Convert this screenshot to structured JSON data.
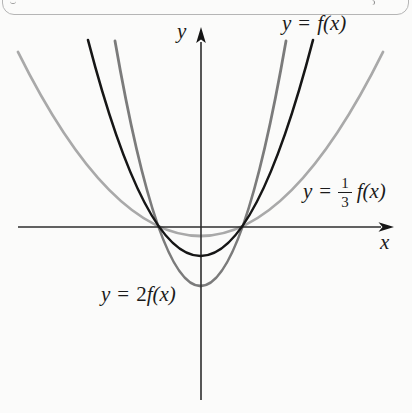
{
  "figure": {
    "axis_labels": {
      "x": "x",
      "y": "y"
    },
    "labels": {
      "f": {
        "y": "y",
        "eq": "=",
        "rhs": "f(x)"
      },
      "two_f": {
        "y": "y",
        "eq": "=",
        "coef": "2",
        "rhs": "f(x)"
      },
      "third_f": {
        "y": "y",
        "eq": "=",
        "num": "1",
        "den": "3",
        "rhs": "f(x)"
      }
    },
    "plot": {
      "axes": {
        "color": "#2e2e2e",
        "arrow_color": "#151515",
        "stroke_width": 1.6,
        "x": {
          "y": 227,
          "from": 18,
          "to": 381,
          "tip": 394
        },
        "y": {
          "x": 201,
          "from": 400,
          "to": 42,
          "tip": 27
        }
      },
      "curves": [
        {
          "id": "one-third-f",
          "label": "y = (1/3)f(x)",
          "color": "#a9a9a9",
          "width": 2.8,
          "layer": "below-axes",
          "x1": 18,
          "y1": 52,
          "x2": 383,
          "y2": 52,
          "vx": 200.5,
          "vy": 236
        },
        {
          "id": "two-f",
          "label": "y = 2f(x)",
          "color": "#7b7b7b",
          "width": 2.8,
          "layer": "below-axes",
          "x1": 115,
          "y1": 41,
          "x2": 286,
          "y2": 41,
          "vx": 200.5,
          "vy": 286
        },
        {
          "id": "f",
          "label": "y = f(x)",
          "color": "#161616",
          "width": 2.6,
          "layer": "above-axes",
          "x1": 88,
          "y1": 40,
          "x2": 313,
          "y2": 40,
          "vx": 200.5,
          "vy": 256
        }
      ]
    }
  },
  "chart_data": {
    "type": "line",
    "title": "",
    "xlabel": "x",
    "ylabel": "y",
    "grid": false,
    "axis_numeric_labels": false,
    "legend": "inline labels next to each curve",
    "x": [
      -2,
      -1.5,
      -1,
      -0.5,
      0,
      0.5,
      1,
      1.5,
      2
    ],
    "series": [
      {
        "name": "y = f(x)",
        "color": "#161616",
        "values": [
          3,
          1.25,
          0,
          -0.75,
          -1,
          -0.75,
          0,
          1.25,
          3
        ]
      },
      {
        "name": "y = 2f(x)",
        "color": "#7b7b7b",
        "values": [
          6,
          2.5,
          0,
          -1.5,
          -2,
          -1.5,
          0,
          2.5,
          6
        ]
      },
      {
        "name": "y = (1/3)f(x)",
        "color": "#a9a9a9",
        "values": [
          1,
          0.42,
          0,
          -0.25,
          -0.33,
          -0.25,
          0,
          0.42,
          1
        ]
      }
    ],
    "note": "No tick labels are shown; values are normalized so f(x) has x-intercepts at ±1 and vertex (0, −1)."
  }
}
